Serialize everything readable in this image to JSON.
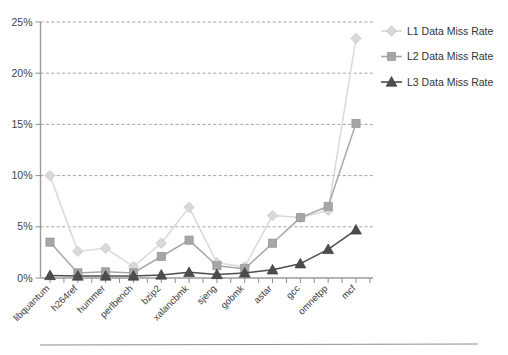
{
  "chart_data": {
    "type": "line",
    "title": "",
    "subtitle": "",
    "xlabel": "",
    "ylabel": "",
    "ylim": [
      0,
      25
    ],
    "ytick_labels": [
      "0%",
      "5%",
      "10%",
      "15%",
      "20%",
      "25%"
    ],
    "ytick_values": [
      0,
      5,
      10,
      15,
      20,
      25
    ],
    "grid": true,
    "grid_axis": "y",
    "legend_position": "right",
    "categories": [
      "libquantum",
      "h264ref",
      "hummer",
      "perlbench",
      "bzip2",
      "xalancbmk",
      "sjeng",
      "gobmk",
      "astar",
      "gcc",
      "omnetpp",
      "mcf"
    ],
    "series": [
      {
        "name": "L1 Data Miss Rate",
        "marker": "diamond",
        "color": "#d9d9d9",
        "line_color": "#d9d9d9",
        "values": [
          10.0,
          2.6,
          2.9,
          1.1,
          3.4,
          6.9,
          1.5,
          1.1,
          6.1,
          5.9,
          6.6,
          23.4
        ]
      },
      {
        "name": "L2 Data Miss Rate",
        "marker": "square",
        "color": "#a6a6a6",
        "line_color": "#a6a6a6",
        "values": [
          3.5,
          0.5,
          0.6,
          0.5,
          2.1,
          3.7,
          1.2,
          0.9,
          3.4,
          5.9,
          7.0,
          15.1
        ]
      },
      {
        "name": "L3 Data Miss Rate",
        "marker": "triangle",
        "color": "#4d4d4d",
        "line_color": "#4d4d4d",
        "values": [
          0.25,
          0.2,
          0.2,
          0.2,
          0.3,
          0.55,
          0.35,
          0.5,
          0.8,
          1.4,
          2.8,
          4.7
        ]
      }
    ]
  },
  "legend": {
    "items": [
      {
        "label": "L1 Data Miss Rate"
      },
      {
        "label": "L2 Data Miss Rate"
      },
      {
        "label": "L3 Data Miss Rate"
      }
    ]
  },
  "axes": {
    "y_labels": [
      "25%",
      "20%",
      "15%",
      "10%",
      "5%",
      "0%"
    ],
    "x_labels": [
      "libquantum",
      "h264ref",
      "hummer",
      "perlbench",
      "bzip2",
      "xalancbmk",
      "sjeng",
      "gobmk",
      "astar",
      "gcc",
      "omnetpp",
      "mcf"
    ]
  },
  "colors": {
    "l1": "#d9d9d9",
    "l2": "#a6a6a6",
    "l3": "#4d4d4d",
    "axis": "#9a9a9a",
    "grid": "#8c8c8c",
    "text": "#3a3a3a",
    "background": "#ffffff"
  }
}
